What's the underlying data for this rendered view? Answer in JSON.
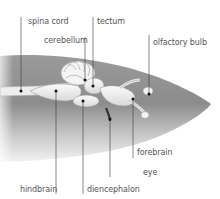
{
  "diagram": {
    "colors": {
      "background": "#ffffff",
      "head_dark": "#8f8f8f",
      "head_light": "#e6e6e6",
      "brain_fill": "#f2f2f2",
      "brain_stroke": "#9a9a9a",
      "leader_line": "#3a3a3a",
      "label_text": "#555555"
    },
    "labels": [
      {
        "id": "spinal-cord",
        "text": "spina cord",
        "x": 28,
        "y": 17,
        "line_x": 21,
        "line_y1": 17,
        "line_y2": 91
      },
      {
        "id": "tectum",
        "text": "tectum",
        "x": 97,
        "y": 17,
        "line_x": 93,
        "line_y1": 17,
        "line_y2": 86
      },
      {
        "id": "cerebellum",
        "text": "cerebellum",
        "x": 44,
        "y": 36,
        "line_x": 85,
        "line_y1": 37,
        "line_y2": 80
      },
      {
        "id": "olfactory-bulb",
        "text": "olfactory bulb",
        "x": 153,
        "y": 38,
        "line_x": 149,
        "line_y1": 35,
        "line_y2": 94
      },
      {
        "id": "forebrain",
        "text": "forebrain",
        "x": 137,
        "y": 148,
        "line_x": 133,
        "line_y1": 99,
        "line_y2": 158
      },
      {
        "id": "eye",
        "text": "eye",
        "x": 143,
        "y": 168,
        "line_x": 110,
        "line_y1": 119,
        "line_y2": 177
      },
      {
        "id": "hindbrain",
        "text": "hindbrain",
        "x": 20,
        "y": 185,
        "line_x": 56,
        "line_y1": 91,
        "line_y2": 194
      },
      {
        "id": "diencephalon",
        "text": "diencephalon",
        "x": 87,
        "y": 185,
        "line_x": 83,
        "line_y1": 101,
        "line_y2": 194
      }
    ]
  }
}
